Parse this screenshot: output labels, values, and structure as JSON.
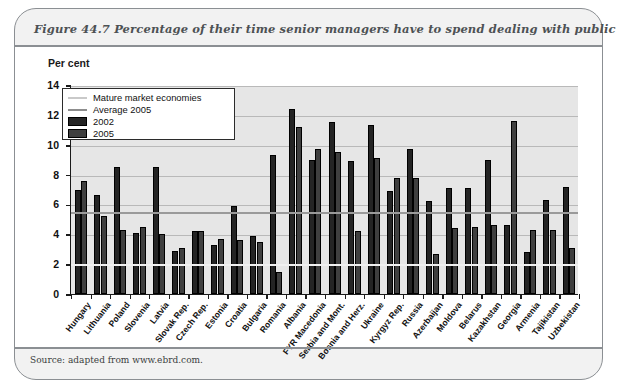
{
  "figure": {
    "title": "Figure 44.7  Percentage of their time senior managers have to spend dealing with public officials",
    "source": "Source: adapted from www.ebrd.com."
  },
  "legend": {
    "items": [
      {
        "label": "Mature market economies",
        "swatch": "line-light",
        "color": "#c9c9c9"
      },
      {
        "label": "Average 2005",
        "swatch": "line-dark",
        "color": "#8d8d8d"
      },
      {
        "label": "2002",
        "swatch": "bar",
        "color": "#242424"
      },
      {
        "label": "2005",
        "swatch": "bar",
        "color": "#3f3f3f"
      }
    ]
  },
  "chart_data": {
    "type": "bar",
    "title": "Percentage of their time senior managers have to spend dealing with public officials",
    "xlabel": "",
    "ylabel": "Per cent",
    "ylim": [
      0,
      14
    ],
    "yticks": [
      0,
      2,
      4,
      6,
      8,
      10,
      12,
      14
    ],
    "grid": true,
    "legend_position": "top-left",
    "categories": [
      "Hungary",
      "Lithuania",
      "Poland",
      "Slovenia",
      "Latvia",
      "Slovak Rep.",
      "Czech Rep.",
      "Estonia",
      "Croatia",
      "Bulgaria",
      "Romania",
      "Albania",
      "FYR Macedonia",
      "Serbia and Mont.",
      "Bosnia and Herz.",
      "Ukraine",
      "Kyrgyz Rep.",
      "Russia",
      "Azerbaijan",
      "Moldova",
      "Belarus",
      "Kazakhstan",
      "Georgia",
      "Armenia",
      "Tajikistan",
      "Uzbekistan"
    ],
    "series": [
      {
        "name": "2002",
        "color": "#242424",
        "values": [
          7.0,
          6.6,
          8.5,
          4.1,
          8.5,
          2.9,
          4.2,
          3.3,
          5.9,
          3.9,
          9.3,
          12.4,
          9.0,
          11.5,
          8.9,
          11.3,
          6.9,
          9.7,
          6.2,
          7.1,
          7.1,
          9.0,
          4.6,
          2.8,
          6.3,
          7.2
        ],
        "bar_order": "first"
      },
      {
        "name": "2005",
        "color": "#3f3f3f",
        "values": [
          7.6,
          5.2,
          4.3,
          4.5,
          4.0,
          3.1,
          4.2,
          3.7,
          3.6,
          3.5,
          1.5,
          11.2,
          9.7,
          9.5,
          4.2,
          9.1,
          7.8,
          7.8,
          2.7,
          4.4,
          4.5,
          4.6,
          11.6,
          4.3,
          4.3,
          3.1
        ],
        "bar_order": "second"
      }
    ],
    "reference_lines": [
      {
        "name": "Mature market economies",
        "value": 2.0,
        "color": "#f0f0f0"
      },
      {
        "name": "Average 2005",
        "value": 5.5,
        "color": "#9a9a9a"
      }
    ]
  }
}
